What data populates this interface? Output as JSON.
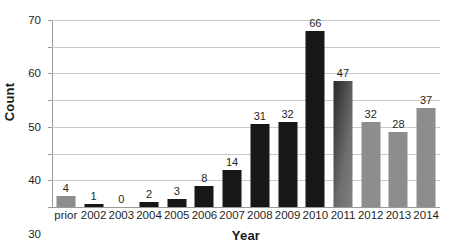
{
  "chart_data": {
    "type": "bar",
    "title": "",
    "subtitle": "",
    "xlabel": "Year",
    "ylabel": "Count",
    "categories": [
      "prior",
      "2002",
      "2003",
      "2004",
      "2005",
      "2006",
      "2007",
      "2008",
      "2009",
      "2010",
      "2011",
      "2012",
      "2013",
      "2014"
    ],
    "values": [
      4,
      1,
      0,
      2,
      3,
      8,
      14,
      31,
      32,
      66,
      47,
      32,
      28,
      37
    ],
    "bar_colors": [
      "#8d8d8d",
      "#171717",
      "#171717",
      "#171717",
      "#171717",
      "#171717",
      "#171717",
      "#171717",
      "#171717",
      "#171717",
      "#5a5a5a",
      "#8d8d8d",
      "#8d8d8d",
      "#8d8d8d"
    ],
    "bar_styles": [
      "gray",
      "dark",
      "dark",
      "dark",
      "dark",
      "dark",
      "dark",
      "dark",
      "dark",
      "dark",
      "grad",
      "gray",
      "gray",
      "gray"
    ],
    "data_labels": [
      "4",
      "1",
      "0",
      "2",
      "3",
      "8",
      "14",
      "31",
      "32",
      "66",
      "47",
      "32",
      "28",
      "37"
    ],
    "ylim": [
      0,
      70
    ],
    "yticks": [
      0,
      10,
      20,
      30,
      40,
      50,
      60,
      70
    ],
    "ytick_labels": [
      "0",
      "10",
      "20",
      "30",
      "40",
      "50",
      "60",
      "70"
    ],
    "grid": true,
    "grid_axis": "y",
    "legend": null,
    "legend_position": "none",
    "data_labels_shown": true,
    "background_color": "#ffffff",
    "grid_color": "#c9c9c9",
    "axis_color": "#9a9a9a",
    "text_color": "#1f1f1f"
  }
}
